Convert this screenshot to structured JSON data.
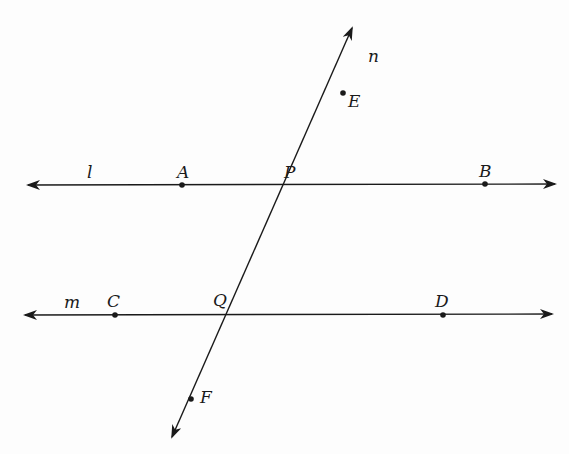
{
  "diagram": {
    "lines": [
      {
        "name": "l",
        "label": "l",
        "label_pos": [
          87,
          178
        ],
        "x1": 28,
        "y1": 185,
        "x2": 555,
        "y2": 184
      },
      {
        "name": "m",
        "label": "m",
        "label_pos": [
          64,
          308
        ],
        "x1": 25,
        "y1": 315,
        "x2": 552,
        "y2": 314
      },
      {
        "name": "n",
        "label": "n",
        "label_pos": [
          368,
          62
        ],
        "x1": 172,
        "y1": 437,
        "x2": 352,
        "y2": 28
      }
    ],
    "points": [
      {
        "name": "A",
        "label": "A",
        "x": 182,
        "y": 185,
        "label_pos": [
          177,
          178
        ],
        "dot": true
      },
      {
        "name": "P",
        "label": "P",
        "x": 290,
        "y": 185,
        "label_pos": [
          284,
          178
        ],
        "dot": false
      },
      {
        "name": "B",
        "label": "B",
        "x": 485,
        "y": 184,
        "label_pos": [
          479,
          177
        ],
        "dot": true
      },
      {
        "name": "E",
        "label": "E",
        "x": 343,
        "y": 93,
        "label_pos": [
          348,
          107
        ],
        "dot": true
      },
      {
        "name": "C",
        "label": "C",
        "x": 115,
        "y": 315,
        "label_pos": [
          107,
          307
        ],
        "dot": true
      },
      {
        "name": "Q",
        "label": "Q",
        "x": 232,
        "y": 314,
        "label_pos": [
          213,
          306
        ],
        "dot": false
      },
      {
        "name": "D",
        "label": "D",
        "x": 443,
        "y": 315,
        "label_pos": [
          435,
          307
        ],
        "dot": true
      },
      {
        "name": "F",
        "label": "F",
        "x": 191,
        "y": 399,
        "label_pos": [
          200,
          403
        ],
        "dot": true
      }
    ],
    "colors": {
      "stroke": "#1a1a1a",
      "background": "#fdfdfd"
    }
  }
}
